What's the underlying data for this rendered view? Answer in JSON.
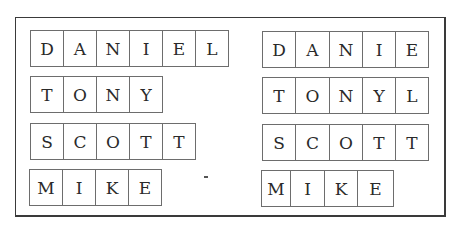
{
  "panels": [
    {
      "side": "left",
      "rows": [
        {
          "word": "DANIEL",
          "letters": [
            "D",
            "A",
            "N",
            "I",
            "E",
            "L"
          ]
        },
        {
          "word": "TONY",
          "letters": [
            "T",
            "O",
            "N",
            "Y"
          ]
        },
        {
          "word": "SCOTT",
          "letters": [
            "S",
            "C",
            "O",
            "T",
            "T"
          ]
        },
        {
          "word": "MIKE",
          "letters": [
            "M",
            "I",
            "K",
            "E"
          ]
        }
      ]
    },
    {
      "side": "right",
      "rows": [
        {
          "word": "DANIE",
          "letters": [
            "D",
            "A",
            "N",
            "I",
            "E"
          ]
        },
        {
          "word": "TONYL",
          "letters": [
            "T",
            "O",
            "N",
            "Y",
            "L"
          ]
        },
        {
          "word": "SCOTT",
          "letters": [
            "S",
            "C",
            "O",
            "T",
            "T"
          ]
        },
        {
          "word": "MIKE",
          "letters": [
            "M",
            "I",
            "K",
            "E"
          ]
        }
      ]
    }
  ]
}
